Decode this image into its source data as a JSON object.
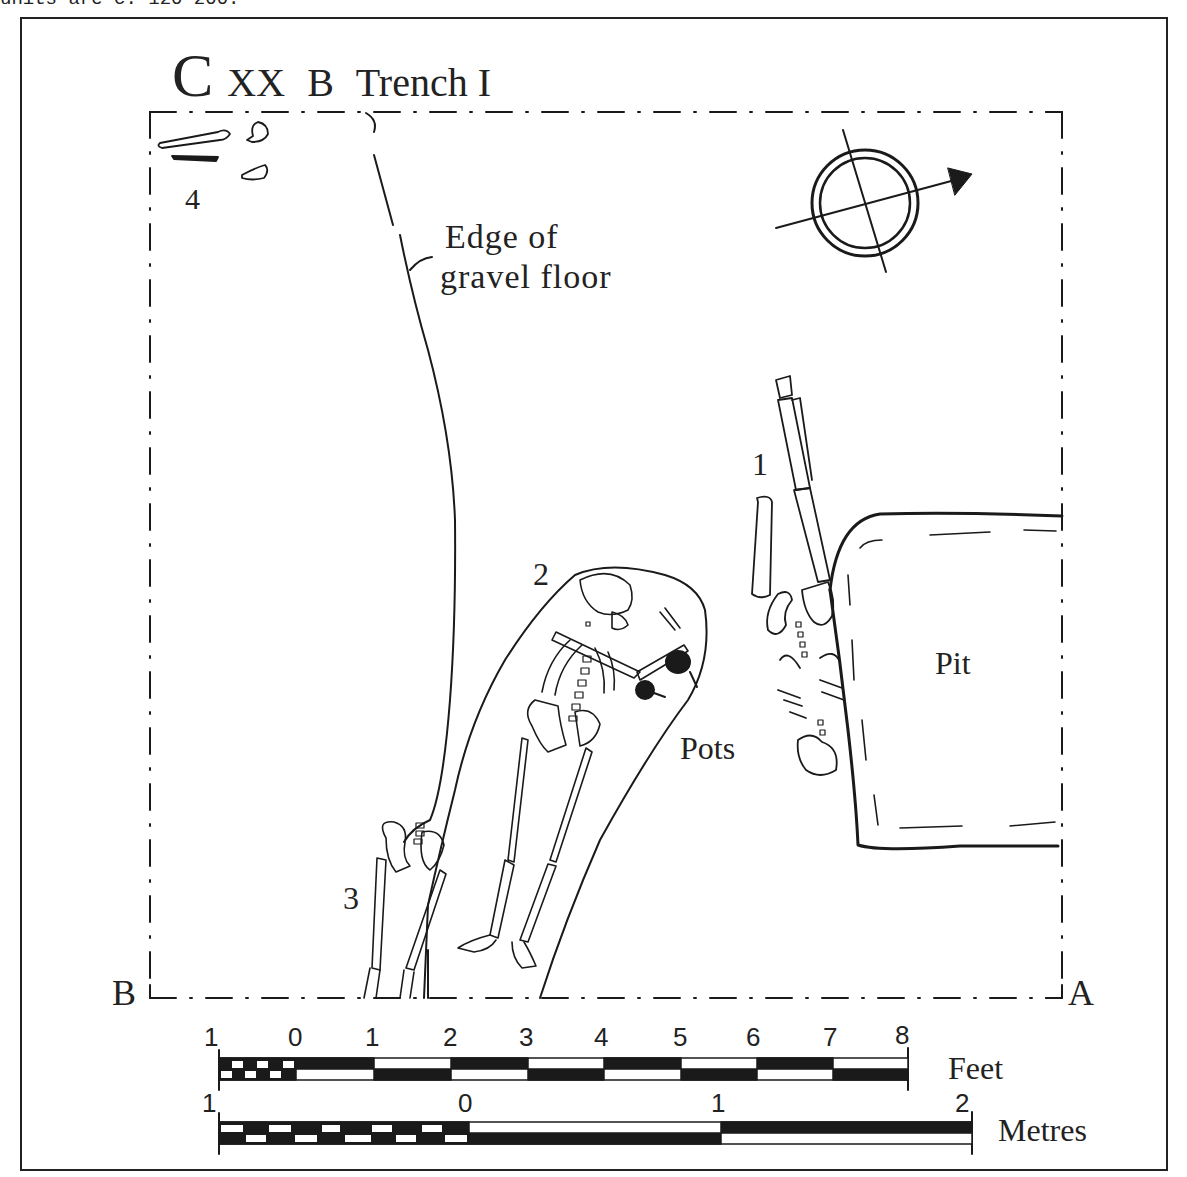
{
  "top_caption": "units are c. 120-200.",
  "title": {
    "site": "C",
    "area": "XX",
    "sub": "B",
    "trench": "Trench I"
  },
  "labels": {
    "burial_1": "1",
    "burial_2": "2",
    "burial_3": "3",
    "burial_4": "4",
    "edge_line1": "Edge of",
    "edge_line2": "gravel floor",
    "pots": "Pots",
    "pit": "Pit",
    "corner_b": "B",
    "corner_a": "A"
  },
  "north_arrow": {
    "icon": "north-arrow-icon"
  },
  "scale_feet": {
    "unit": "Feet",
    "ticks": [
      "1",
      "0",
      "1",
      "2",
      "3",
      "4",
      "5",
      "6",
      "7",
      "8"
    ]
  },
  "scale_metres": {
    "unit": "Metres",
    "ticks": [
      "1",
      "0",
      "1",
      "2"
    ]
  }
}
